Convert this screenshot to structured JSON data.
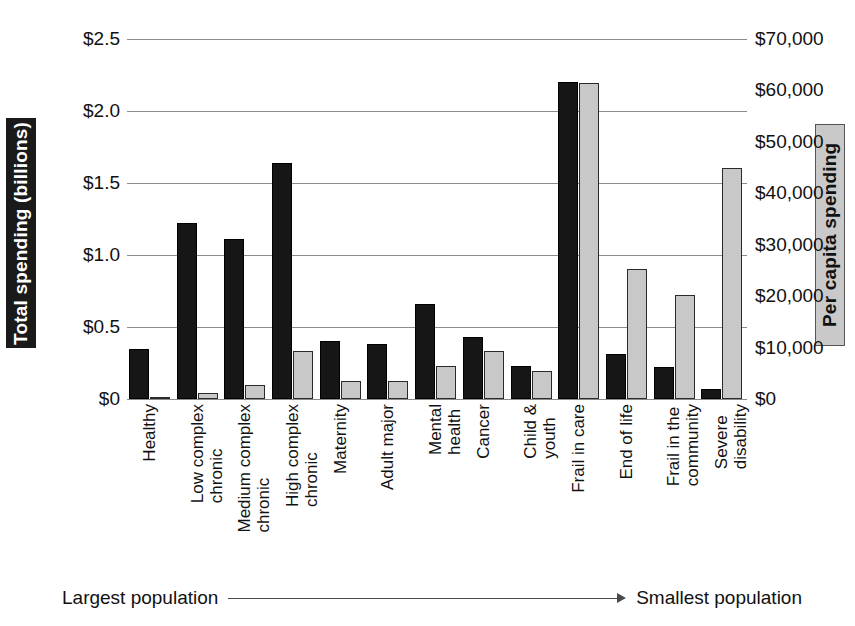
{
  "chart_data": {
    "type": "bar",
    "title": "",
    "categories": [
      "Healthy",
      "Low complex chronic",
      "Medium complex chronic",
      "High complex chronic",
      "Maternity",
      "Adult major",
      "Mental health",
      "Cancer",
      "Child & youth",
      "Frail in care",
      "End of life",
      "Frail in the community",
      "Severe disability"
    ],
    "category_labels_wrapped": [
      "Healthy",
      "Low complex\nchronic",
      "Medium complex\nchronic",
      "High complex\nchronic",
      "Maternity",
      "Adult major",
      "Mental\nhealth",
      "Cancer",
      "Child &\nyouth",
      "Frail in care",
      "End of life",
      "Frail in the\ncommunity",
      "Severe\ndisability"
    ],
    "series": [
      {
        "name": "Total spending (billions)",
        "axis": "left",
        "color": "#161616",
        "values": [
          0.35,
          1.22,
          1.11,
          1.64,
          0.4,
          0.38,
          0.66,
          0.43,
          0.23,
          2.2,
          0.31,
          0.22,
          0.07
        ]
      },
      {
        "name": "Per capita spending",
        "axis": "right",
        "color": "#c8c8c8",
        "values": [
          400,
          1100,
          2800,
          9300,
          3600,
          3500,
          6500,
          9300,
          5500,
          61500,
          25200,
          20200,
          45000
        ]
      }
    ],
    "ylabel": "Total spending (billions)",
    "ylabel_right": "Per capita spending",
    "xlabel": "",
    "ylim": [
      0,
      2.5
    ],
    "ylim_right": [
      0,
      70000
    ],
    "yticks_left": [
      "$0",
      "$0.5",
      "$1.0",
      "$1.5",
      "$2.0",
      "$2.5"
    ],
    "yticks_left_values": [
      0,
      0.5,
      1.0,
      1.5,
      2.0,
      2.5
    ],
    "yticks_right": [
      "$0",
      "$10,000",
      "$20,000",
      "$30,000",
      "$40,000",
      "$50,000",
      "$60,000",
      "$70,000"
    ],
    "yticks_right_values": [
      0,
      10000,
      20000,
      30000,
      40000,
      50000,
      60000,
      70000
    ],
    "grid": true,
    "legend_position": "none",
    "annotations": {
      "left_text": "Largest population",
      "right_text": "Smallest population",
      "arrow": "right-arrow"
    }
  }
}
